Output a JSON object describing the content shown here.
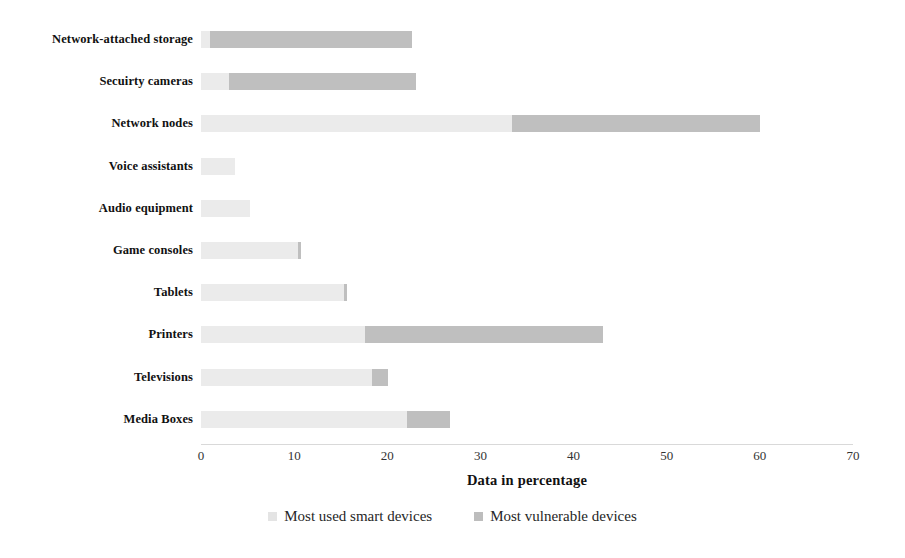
{
  "chart_data": {
    "type": "bar",
    "orientation": "horizontal",
    "stacked": true,
    "title": "",
    "xlabel": "Data in percentage",
    "ylabel": "",
    "xlim": [
      0,
      70
    ],
    "xticks": [
      0,
      10,
      20,
      30,
      40,
      50,
      60,
      70
    ],
    "grid": false,
    "legend_position": "bottom",
    "categories": [
      "Network-attached storage",
      "Secuirty cameras",
      "Network nodes",
      "Voice assistants",
      "Audio equipment",
      "Game consoles",
      "Tablets",
      "Printers",
      "Televisions",
      "Media Boxes"
    ],
    "series": [
      {
        "name": "Most used smart devices",
        "color": "#ebebeb",
        "values": [
          1,
          3,
          33.4,
          3.7,
          5.3,
          10.4,
          15.4,
          17.6,
          18.4,
          22.1
        ]
      },
      {
        "name": "Most vulnerable devices",
        "color": "#bfbfbf",
        "values": [
          21.6,
          20.1,
          26.6,
          0,
          0,
          0.3,
          0.3,
          25.6,
          1.7,
          4.6
        ]
      }
    ],
    "totals": [
      22.6,
      23.1,
      60,
      3.7,
      5.3,
      10.7,
      15.7,
      43.2,
      20.1,
      26.7
    ]
  },
  "legend": {
    "items": [
      {
        "label": "Most used smart devices",
        "swatch": "legend-swatch-used"
      },
      {
        "label": "Most vulnerable devices",
        "swatch": "legend-swatch-vulnerable"
      }
    ]
  }
}
